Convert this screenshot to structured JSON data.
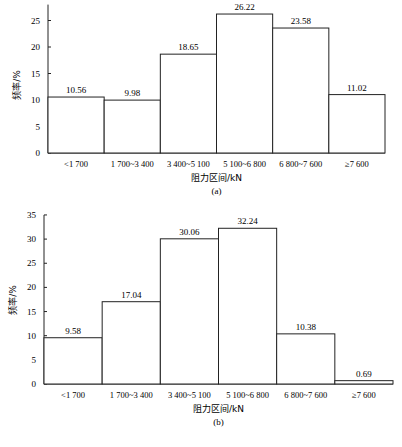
{
  "chart_data": [
    {
      "type": "bar",
      "panel_label": "(a)",
      "title": "",
      "xlabel": "阻力区间/kN",
      "ylabel": "频率/%",
      "categories": [
        "<1 700",
        "1 700~3 400",
        "3 400~5 100",
        "5 100~6 800",
        "6 800~7 600",
        "≥7 600"
      ],
      "values": [
        10.56,
        9.98,
        18.65,
        26.22,
        23.58,
        11.02
      ],
      "value_labels": [
        "10.56",
        "9.98",
        "18.65",
        "26.22",
        "23.58",
        "11.02"
      ],
      "yticks": [
        0,
        5,
        10,
        15,
        20,
        25
      ],
      "ylim": [
        0,
        28
      ],
      "grid": false,
      "legend": null
    },
    {
      "type": "bar",
      "panel_label": "(b)",
      "title": "",
      "xlabel": "阻力区间/kN",
      "ylabel": "频率/%",
      "categories": [
        "<1 700",
        "1 700~3 400",
        "3 400~5 100",
        "5 100~6 800",
        "6 800~7 600",
        "≥7 600"
      ],
      "values": [
        9.58,
        17.04,
        30.06,
        32.24,
        10.38,
        0.69
      ],
      "value_labels": [
        "9.58",
        "17.04",
        "30.06",
        "32.24",
        "10.38",
        "0.69"
      ],
      "yticks": [
        0,
        5,
        10,
        15,
        20,
        25,
        30,
        35
      ],
      "ylim": [
        0,
        35
      ],
      "grid": false,
      "legend": null
    }
  ],
  "colors": {
    "bar_fill": "#ffffff",
    "bar_stroke": "#222222",
    "axis": "#222222"
  }
}
